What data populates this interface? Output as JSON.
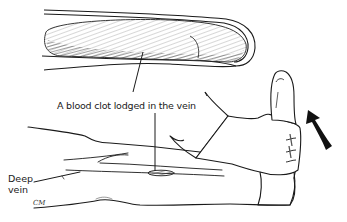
{
  "figure": {
    "labels": {
      "clot": "A blood clot lodged in the vein",
      "deep_vein_line1": "Deep",
      "deep_vein_line2": "vein"
    },
    "signature": "CM",
    "elements": [
      "vein-cross-section-with-clot",
      "leg",
      "hand-dorsiflexing-foot",
      "curved-arrow-upward"
    ],
    "colors": {
      "line": "#1a1a1a",
      "shading": "#555555",
      "background": "#ffffff"
    }
  }
}
